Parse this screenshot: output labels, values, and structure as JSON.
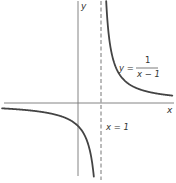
{
  "chart_data": {
    "type": "line",
    "title": "",
    "xlabel": "x",
    "ylabel": "y",
    "function": "y = 1/(x - 1)",
    "curve_label": {
      "lhs": "y =",
      "numerator": "1",
      "denominator": "x − 1"
    },
    "asymptote_label": "x = 1",
    "vertical_asymptote": 1,
    "horizontal_asymptote": 0,
    "xlim": [
      -3.3,
      4.1
    ],
    "ylim": [
      -3.1,
      4.4
    ],
    "grid": false,
    "legend": "none",
    "series": [
      {
        "name": "left branch (x < 1)",
        "x": [
          -3.3,
          -3,
          -2,
          -1,
          -0.5,
          0,
          0.25,
          0.5,
          0.7,
          0.9,
          0.97
        ],
        "y": [
          -0.233,
          -0.25,
          -0.333,
          -0.5,
          -0.667,
          -1,
          -1.333,
          -2,
          -3.333,
          -10,
          -33.3
        ]
      },
      {
        "name": "right branch (x > 1)",
        "x": [
          1.03,
          1.1,
          1.25,
          1.5,
          2,
          2.5,
          3,
          3.5,
          4,
          4.1
        ],
        "y": [
          33.3,
          10,
          4,
          2,
          1,
          0.667,
          0.5,
          0.4,
          0.333,
          0.323
        ]
      }
    ]
  },
  "colors": {
    "background": "#ffffff",
    "axis": "#666666",
    "curve": "#444444",
    "asymptote": "#555555",
    "text": "#333333"
  }
}
